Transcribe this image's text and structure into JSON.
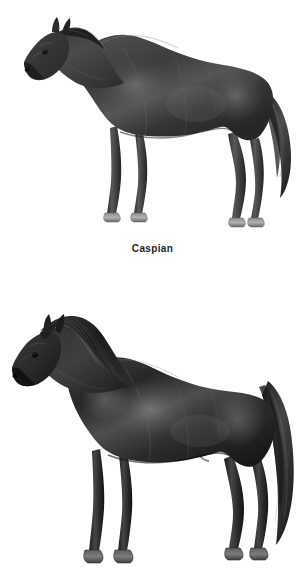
{
  "page": {
    "background_color": "#ffffff",
    "width": 305,
    "height": 582,
    "kind": "illustration-plate",
    "medium": "grayscale pencil / airbrush rendering"
  },
  "palette": {
    "background": "#ffffff",
    "body_dark": "#3a3a3a",
    "body_darker": "#262626",
    "body_black": "#151515",
    "highlight_mid": "#6e6e6e",
    "highlight_light": "#9a9a9a",
    "hoof_gray": "#9c9c9c",
    "hoof_edge": "#5d5d5d",
    "caption_text": "#201f1f"
  },
  "figures": [
    {
      "id": "caspian",
      "caption": "Caspian",
      "has_caption": true,
      "subject": "horse",
      "icon": "horse-standing-left-icon",
      "orientation": "facing-left",
      "pose": "standing-in-profile",
      "coat": "dark bay / near-black, glossy with light dapple highlights",
      "mane": "short, neat, laid over crest",
      "tail": "fine, softly flowing, carried slightly away from hindquarters",
      "build": "fine-boned, refined small horse",
      "legs_visible": 4,
      "hooves_visible": 4,
      "hoof_color": "light gray",
      "bbox": {
        "x": 22,
        "y": 27,
        "width": 268,
        "height": 200
      }
    },
    {
      "id": "second-horse",
      "caption": "",
      "has_caption": false,
      "subject": "horse",
      "icon": "horse-standing-left-icon",
      "orientation": "facing-left",
      "pose": "standing-in-profile",
      "coat": "black, matte with broad gray highlights over barrel and shoulder",
      "mane": "long, thick, heavily flowing over the neck",
      "tail": "long, full and thick, reaching past the hocks",
      "build": "sturdy, deep-bodied pony type",
      "legs_visible": 4,
      "hooves_visible": 4,
      "hoof_color": "dark gray",
      "bbox": {
        "x": 12,
        "y": 313,
        "width": 280,
        "height": 269
      },
      "note": "lower edge of plate; no caption rendered in frame"
    }
  ]
}
